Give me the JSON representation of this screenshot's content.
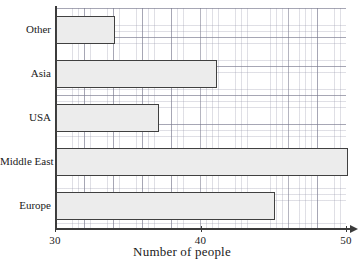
{
  "chart_data": {
    "type": "bar",
    "orientation": "horizontal",
    "title": "",
    "xlabel": "Number of people",
    "ylabel": "",
    "categories": [
      "Other",
      "Asia",
      "USA",
      "Middle East",
      "Europe"
    ],
    "values": [
      34,
      41,
      37,
      50,
      45
    ],
    "xlim": [
      30,
      50
    ],
    "xticks": [
      30,
      40,
      50
    ],
    "xtick_labels": [
      "30",
      "40",
      "50"
    ],
    "grid": true,
    "grid_minor": true,
    "legend": null,
    "bar_fill_color": "#ececec",
    "bar_edge_color": "#404040",
    "axis_color": "#3b3b3b",
    "grid_color": "#9696aa",
    "background_color": "#ffffff"
  },
  "axis": {
    "x_title": "Number of people"
  }
}
